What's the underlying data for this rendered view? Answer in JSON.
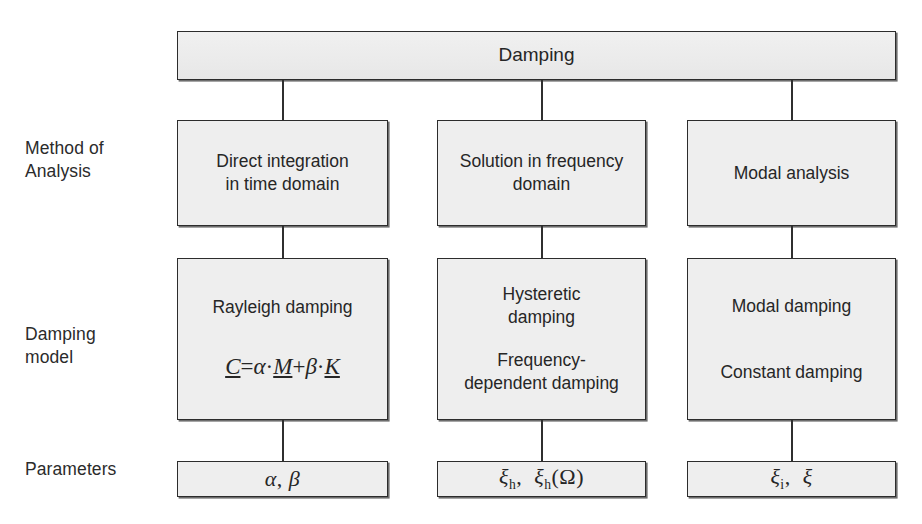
{
  "figure": {
    "kind": "hierarchy-flowchart",
    "colors": {
      "box_fill": "#eeeeee",
      "box_border": "#2c2c2c",
      "line": "#2f2f2f",
      "text": "#262626",
      "page_background": "#ffffff"
    }
  },
  "root": {
    "label": "Damping"
  },
  "row_labels": {
    "method": "Method of\nAnalysis",
    "model": "Damping\nmodel",
    "parameters": "Parameters"
  },
  "columns": [
    {
      "method": "Direct integration\nin time domain",
      "model_primary": "Rayleigh damping",
      "model_secondary": "",
      "model_formula": {
        "lhs": "C",
        "eq": "=",
        "term1_coeff": "α",
        "dot1": "·",
        "term1_matrix": "M",
        "plus": "+",
        "term2_coeff": "β",
        "dot2": "·",
        "term2_matrix": "K",
        "plain": "C = α · M + β · K"
      },
      "parameters": {
        "items": [
          {
            "symbol": "α",
            "subscript": "",
            "argument": ""
          },
          {
            "symbol": "β",
            "subscript": "",
            "argument": ""
          }
        ],
        "plain": "α, β"
      }
    },
    {
      "method": "Solution in frequency\ndomain",
      "model_primary": "Hysteretic\ndamping",
      "model_secondary": "Frequency-\ndependent damping",
      "model_formula": null,
      "parameters": {
        "items": [
          {
            "symbol": "ξ",
            "subscript": "h",
            "argument": ""
          },
          {
            "symbol": "ξ",
            "subscript": "h",
            "argument": "(Ω)"
          }
        ],
        "plain": "ξh, ξh(Ω)"
      }
    },
    {
      "method": "Modal analysis",
      "model_primary": "Modal damping",
      "model_secondary": "Constant damping",
      "model_formula": null,
      "parameters": {
        "items": [
          {
            "symbol": "ξ",
            "subscript": "i",
            "argument": ""
          },
          {
            "symbol": "ξ",
            "subscript": "",
            "argument": ""
          }
        ],
        "plain": "ξi, ξ"
      }
    }
  ]
}
